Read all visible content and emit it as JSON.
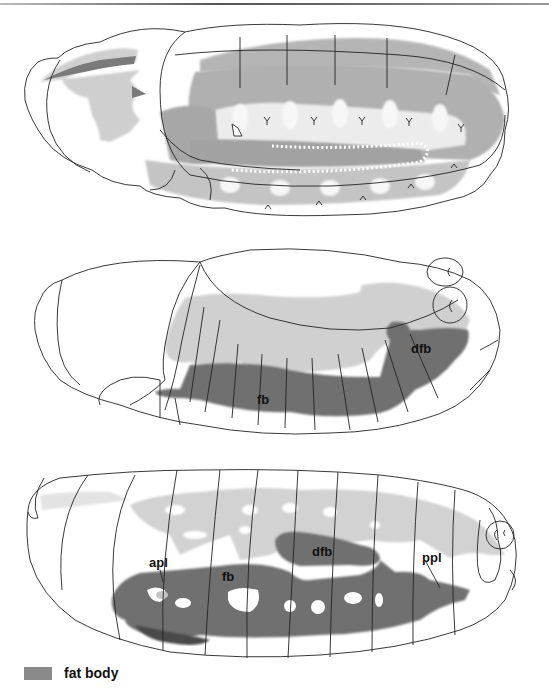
{
  "figure": {
    "panels": [
      {
        "id": "panel-top",
        "labels": []
      },
      {
        "id": "panel-middle",
        "labels": [
          "dfb",
          "fb"
        ]
      },
      {
        "id": "panel-bottom",
        "labels": [
          "dfb",
          "apl",
          "ppl",
          "fb"
        ]
      }
    ],
    "labels": {
      "middle_dfb": "dfb",
      "middle_fb": "fb",
      "bottom_dfb": "dfb",
      "bottom_apl": "apl",
      "bottom_ppl": "ppl",
      "bottom_fb": "fb"
    },
    "legend": {
      "label": "fat body",
      "color": "#8a8a8a"
    },
    "colors": {
      "fat_body_dark": "#6e6e6e",
      "tissue_light": "#c8c8c8",
      "tissue_mid": "#a9a9a9",
      "outline": "#222222"
    }
  }
}
